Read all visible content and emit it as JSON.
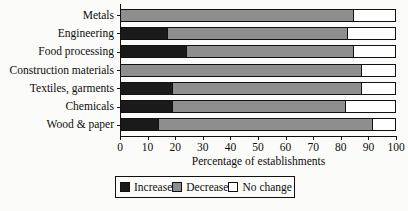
{
  "chart_data": {
    "type": "bar",
    "orientation": "horizontal",
    "stacked": true,
    "title": "",
    "xlabel": "Percentage of establishments",
    "ylabel": "",
    "xlim": [
      0,
      100
    ],
    "xticks": [
      0,
      10,
      20,
      30,
      40,
      50,
      60,
      70,
      80,
      90,
      100
    ],
    "grid": false,
    "legend_position": "bottom",
    "categories": [
      "Metals",
      "Engineering",
      "Food processing",
      "Construction materials",
      "Textiles, garments",
      "Chemicals",
      "Wood & paper"
    ],
    "series": [
      {
        "name": "Increase",
        "color": "#1a1a1a",
        "values": [
          0,
          17,
          24,
          0,
          19,
          19,
          14
        ]
      },
      {
        "name": "Decrease",
        "color": "#8e8e8e",
        "values": [
          85,
          66,
          61,
          88,
          69,
          63,
          78
        ]
      },
      {
        "name": "No change",
        "color": "#ffffff",
        "values": [
          15,
          17,
          15,
          12,
          12,
          18,
          8
        ]
      }
    ]
  },
  "legend": {
    "items": [
      {
        "label": "Increase",
        "swatch": "increase"
      },
      {
        "label": "Decrease",
        "swatch": "decrease"
      },
      {
        "label": "No change",
        "swatch": "nochange"
      }
    ]
  },
  "colors": {
    "increase": "#1a1a1a",
    "decrease": "#8e8e8e",
    "nochange": "#ffffff",
    "axis": "#111111",
    "background": "#fbfbf9"
  }
}
